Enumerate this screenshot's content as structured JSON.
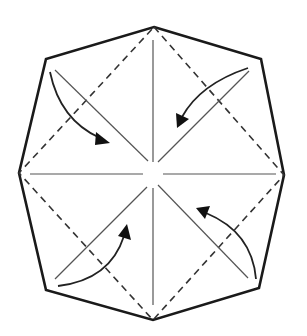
{
  "diagram": {
    "type": "origami-fold-diagram",
    "colors": {
      "outline": "#1a1a1a",
      "dashed": "#333333",
      "crease": "#555555",
      "arrow": "#222222",
      "background": "#ffffff"
    },
    "octagon_points": "154,27 261,59 284,175 259,288 153,320 46,290 19,173 46,59",
    "dashed_square_points": "154,27 284,175 153,320 19,173",
    "creases": [
      {
        "name": "crease-top-left",
        "x1": 55,
        "y1": 70,
        "x2": 148,
        "y2": 161
      },
      {
        "name": "crease-top-right",
        "x1": 249,
        "y1": 71,
        "x2": 158,
        "y2": 162
      },
      {
        "name": "crease-bottom-left",
        "x1": 55,
        "y1": 279,
        "x2": 147,
        "y2": 187
      },
      {
        "name": "crease-bottom-right",
        "x1": 248,
        "y1": 278,
        "x2": 158,
        "y2": 185
      },
      {
        "name": "crease-vertical-top",
        "x1": 153,
        "y1": 40,
        "x2": 153,
        "y2": 162
      },
      {
        "name": "crease-vertical-bottom",
        "x1": 153,
        "y1": 188,
        "x2": 153,
        "y2": 305
      },
      {
        "name": "crease-horizontal-left",
        "x1": 30,
        "y1": 174,
        "x2": 143,
        "y2": 174
      },
      {
        "name": "crease-horizontal-right",
        "x1": 163,
        "y1": 174,
        "x2": 276,
        "y2": 174
      }
    ],
    "arrows": [
      {
        "name": "arrow-top-left",
        "path": "M50,72 Q60,120 100,138",
        "head": "110,143 96,132 95,145"
      },
      {
        "name": "arrow-top-right",
        "path": "M248,68 Q200,84 182,117",
        "head": "177,128 176,113 189,119"
      },
      {
        "name": "arrow-bottom-left",
        "path": "M58,286 Q110,280 124,236",
        "head": "127,224 118,236 131,240"
      },
      {
        "name": "arrow-bottom-right",
        "path": "M256,279 Q252,232 206,213",
        "head": "196,208 210,206 205,219"
      }
    ]
  }
}
